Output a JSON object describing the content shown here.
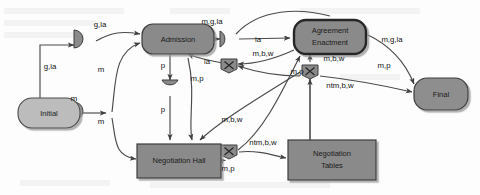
{
  "diagram": {
    "colors": {
      "node_fill": "#8a8a8a",
      "node_stroke": "#3d3d3d",
      "initial_fill": "#bcbcbc",
      "final_fill": "#8e8e8e",
      "emphasis_stroke": "#2b2b2b",
      "edge_stroke": "#4a4a4a",
      "text": "#111111",
      "background": "#fdfdfd"
    },
    "nodes": [
      {
        "id": "initial",
        "label": "Initial",
        "shape": "stadium",
        "x": 18,
        "y": 98,
        "w": 62,
        "h": 30
      },
      {
        "id": "admission",
        "label": "Admission",
        "shape": "stadium",
        "x": 142,
        "y": 24,
        "w": 72,
        "h": 30
      },
      {
        "id": "agreement",
        "label": "Agreement Enactment",
        "shape": "stadium-bold",
        "x": 294,
        "y": 20,
        "w": 72,
        "h": 34
      },
      {
        "id": "neg_hall",
        "label": "Negotiation Hall",
        "shape": "rect",
        "x": 137,
        "y": 144,
        "w": 84,
        "h": 34
      },
      {
        "id": "neg_tables",
        "label": "Negotiation Tables",
        "shape": "rect",
        "x": 288,
        "y": 140,
        "w": 88,
        "h": 40
      },
      {
        "id": "final",
        "label": "Final",
        "shape": "stadium",
        "x": 414,
        "y": 78,
        "w": 54,
        "h": 32
      }
    ],
    "junctions": [
      {
        "id": "j-merge-top",
        "kind": "half-disc-right",
        "x": 85,
        "y": 38
      },
      {
        "id": "j-merge-left",
        "kind": "half-disc-right",
        "x": 85,
        "y": 110
      },
      {
        "id": "j-split-adm",
        "kind": "half-disc-right",
        "x": 228,
        "y": 38
      },
      {
        "id": "j-merge-down",
        "kind": "half-disc-down",
        "x": 170,
        "y": 87
      },
      {
        "id": "j-x-mid",
        "kind": "x-pentagon",
        "x": 229,
        "y": 64
      },
      {
        "id": "j-x-right",
        "kind": "x-pentagon",
        "x": 310,
        "y": 70
      },
      {
        "id": "j-x-bottom",
        "kind": "x-pentagon",
        "x": 229,
        "y": 150
      }
    ],
    "edge_labels": [
      {
        "id": "lbl-g-la-top",
        "text": "g,la",
        "x": 100,
        "y": 25
      },
      {
        "id": "lbl-g-la-left",
        "text": "g,la",
        "x": 50,
        "y": 67
      },
      {
        "id": "lbl-m-initial",
        "text": "m",
        "x": 74,
        "y": 99
      },
      {
        "id": "lbl-m-up",
        "text": "m",
        "x": 101,
        "y": 70
      },
      {
        "id": "lbl-m-down",
        "text": "m",
        "x": 101,
        "y": 122
      },
      {
        "id": "lbl-m-g-la-adm",
        "text": "m,g,la",
        "x": 212,
        "y": 22
      },
      {
        "id": "lbl-la-split",
        "text": "la",
        "x": 258,
        "y": 40
      },
      {
        "id": "lbl-la-back",
        "text": "la",
        "x": 207,
        "y": 62
      },
      {
        "id": "lbl-m-b-w-mid",
        "text": "m,b,w",
        "x": 263,
        "y": 54
      },
      {
        "id": "lbl-m-p-adm",
        "text": "m,p",
        "x": 197,
        "y": 79
      },
      {
        "id": "lbl-p-top",
        "text": "p",
        "x": 163,
        "y": 66
      },
      {
        "id": "lbl-p-bottom",
        "text": "p",
        "x": 163,
        "y": 110
      },
      {
        "id": "lbl-m-b-w-low",
        "text": "m,b,w",
        "x": 232,
        "y": 120
      },
      {
        "id": "lbl-m-p-right",
        "text": "m,p",
        "x": 297,
        "y": 72
      },
      {
        "id": "lbl-m-b-w-agr",
        "text": "m,b,w",
        "x": 334,
        "y": 59
      },
      {
        "id": "lbl-ntm-b-w-up",
        "text": "ntm,b,w",
        "x": 340,
        "y": 86
      },
      {
        "id": "lbl-m-g-la-final",
        "text": "m,g,la",
        "x": 392,
        "y": 40
      },
      {
        "id": "lbl-m-p-final",
        "text": "m,p",
        "x": 384,
        "y": 66
      },
      {
        "id": "lbl-m-p-hall",
        "text": "m,p",
        "x": 228,
        "y": 169
      },
      {
        "id": "lbl-ntm-b-w-tbl",
        "text": "ntm,b,w",
        "x": 263,
        "y": 143
      }
    ]
  }
}
